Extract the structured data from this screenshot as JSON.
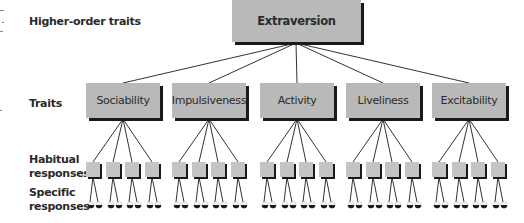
{
  "row_labels": {
    "higher_order": "Higher-order traits",
    "traits": "Traits",
    "habitual_1": "Habitual",
    "habitual_2": "responses",
    "specific_1": "Specific",
    "specific_2": "responses"
  },
  "higher_order_trait": {
    "label": "Extraversion"
  },
  "traits": [
    {
      "label": "Sociability"
    },
    {
      "label": "Impulsiveness"
    },
    {
      "label": "Activity"
    },
    {
      "label": "Liveliness"
    },
    {
      "label": "Excitability"
    }
  ],
  "habitual_responses_per_trait": 4,
  "specific_responses_per_habitual": 2,
  "colors": {
    "box_fill": "#b9b9b9",
    "box_shadow": "#1a1a1a",
    "line": "#333333",
    "text": "#2a2a2a"
  }
}
